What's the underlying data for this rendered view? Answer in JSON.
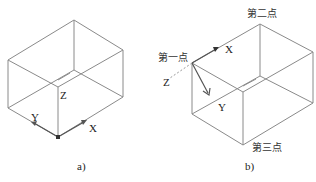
{
  "figure_a": {
    "caption": "a)",
    "axis_labels": {
      "x": "X",
      "y": "Y",
      "z": "Z"
    }
  },
  "figure_b": {
    "caption": "b)",
    "axis_labels": {
      "x": "X",
      "y": "Y",
      "z": "Z"
    },
    "points": {
      "first": "第一点",
      "second": "第二点",
      "third": "第三点"
    }
  },
  "colors": {
    "edge": "#8a8a8a",
    "text": "#222222"
  }
}
